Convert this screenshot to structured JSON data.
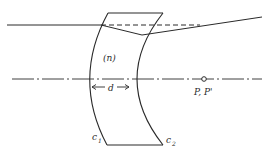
{
  "diagram": {
    "type": "thick-lens-ray-diagram",
    "labels": {
      "medium": "(n)",
      "thickness": "d",
      "surface1": "c",
      "surface1_sub": "1",
      "surface2": "c",
      "surface2_sub": "2",
      "principal_points": "P, P'"
    },
    "colors": {
      "line": "#2a2a2a",
      "background": "#ffffff"
    }
  }
}
